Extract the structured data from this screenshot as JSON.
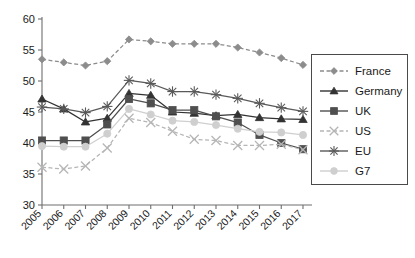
{
  "chart_data": {
    "type": "line",
    "title": "",
    "subtitle": "",
    "xlabel": "",
    "ylabel": "",
    "categories": [
      "2005",
      "2006",
      "2007",
      "2008",
      "2009",
      "2010",
      "2011",
      "2012",
      "2013",
      "2014",
      "2015",
      "2016",
      "2017"
    ],
    "x_tick_labels": [
      "2005",
      "2006",
      "2007",
      "2008",
      "2009",
      "2010",
      "2011",
      "2012",
      "2013",
      "2014",
      "2015",
      "2016",
      "2017"
    ],
    "y_tick_labels": [
      "30",
      "35",
      "40",
      "45",
      "50",
      "55",
      "60"
    ],
    "y_ticks": [
      30,
      35,
      40,
      45,
      50,
      55,
      60
    ],
    "ylim": [
      30,
      60
    ],
    "grid": false,
    "legend_position": "right",
    "series": [
      {
        "name": "France",
        "color": "#8c8c8c",
        "marker": "diamond",
        "line_style": "dashed",
        "values": [
          53.5,
          53.0,
          52.5,
          53.2,
          56.7,
          56.4,
          56.0,
          56.0,
          56.0,
          55.4,
          54.6,
          53.7,
          52.6
        ]
      },
      {
        "name": "Germany",
        "color": "#333333",
        "marker": "triangle",
        "line_style": "solid",
        "values": [
          47.1,
          45.5,
          43.4,
          44.0,
          48.0,
          47.7,
          45.0,
          44.8,
          44.4,
          44.6,
          44.1,
          43.9,
          43.8
        ]
      },
      {
        "name": "UK",
        "color": "#4f4f4f",
        "marker": "square",
        "line_style": "solid",
        "values": [
          40.4,
          40.4,
          40.4,
          43.0,
          47.1,
          46.4,
          45.3,
          45.3,
          44.3,
          43.3,
          41.3,
          40.0,
          39.0
        ]
      },
      {
        "name": "US",
        "color": "#b5b5b5",
        "marker": "cross",
        "line_style": "dashed",
        "values": [
          36.1,
          35.8,
          36.3,
          39.2,
          44.0,
          43.3,
          41.9,
          40.6,
          40.4,
          39.6,
          39.6,
          39.8,
          38.9
        ]
      },
      {
        "name": "EU",
        "color": "#5a5a5a",
        "marker": "asterisk",
        "line_style": "solid",
        "values": [
          45.8,
          45.5,
          44.9,
          45.9,
          50.1,
          49.6,
          48.3,
          48.3,
          47.8,
          47.2,
          46.4,
          45.7,
          45.1
        ]
      },
      {
        "name": "G7",
        "color": "#cfcfcf",
        "marker": "circle",
        "line_style": "solid",
        "values": [
          39.5,
          39.4,
          39.4,
          41.5,
          45.5,
          44.6,
          43.6,
          43.4,
          42.9,
          42.3,
          41.8,
          41.7,
          41.3
        ]
      }
    ]
  },
  "axes": {
    "y_labels": [
      "60",
      "55",
      "50",
      "45",
      "40",
      "35",
      "30"
    ],
    "x_labels": [
      "2005",
      "2006",
      "2007",
      "2008",
      "2009",
      "2010",
      "2011",
      "2012",
      "2013",
      "2014",
      "2015",
      "2016",
      "2017"
    ]
  },
  "legend": {
    "items": [
      {
        "label": "France",
        "color": "#8c8c8c",
        "marker": "diamond",
        "line_style": "dashed"
      },
      {
        "label": "Germany",
        "color": "#333333",
        "marker": "triangle",
        "line_style": "solid"
      },
      {
        "label": "UK",
        "color": "#4f4f4f",
        "marker": "square",
        "line_style": "solid"
      },
      {
        "label": "US",
        "color": "#b5b5b5",
        "marker": "cross",
        "line_style": "dashed"
      },
      {
        "label": "EU",
        "color": "#5a5a5a",
        "marker": "asterisk",
        "line_style": "solid"
      },
      {
        "label": "G7",
        "color": "#cfcfcf",
        "marker": "circle",
        "line_style": "solid"
      }
    ]
  },
  "colors": {
    "axis": "#6e6e6e",
    "text": "#1a1a1a",
    "background": "#ffffff",
    "legend_border": "#4a4a4a"
  }
}
